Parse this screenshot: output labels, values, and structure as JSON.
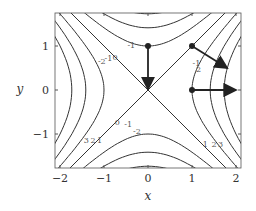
{
  "chart_data": {
    "type": "contour",
    "function": "x^2 - y^2",
    "xlabel": "x",
    "ylabel": "y",
    "xlim": [
      -2.2,
      2.15
    ],
    "ylim": [
      -1.75,
      1.75
    ],
    "xticks": [
      "-2",
      "-1",
      "0",
      "1",
      "2"
    ],
    "yticks": [
      "-1",
      "0",
      "1"
    ],
    "contour_levels": [
      -3,
      -2,
      -1,
      0,
      1,
      2,
      3
    ],
    "contour_labels": [
      "-3",
      "-2",
      "-1",
      "0",
      "1",
      "2",
      "3"
    ],
    "vectors": [
      {
        "from": [
          0,
          1
        ],
        "to": [
          0,
          0.02
        ]
      },
      {
        "from": [
          1,
          1
        ],
        "to": [
          1.8,
          0.5
        ]
      },
      {
        "from": [
          1,
          0
        ],
        "to": [
          2.0,
          0
        ]
      }
    ],
    "points": [
      [
        0,
        1
      ],
      [
        1,
        1
      ],
      [
        1,
        0
      ]
    ],
    "grid": false
  }
}
